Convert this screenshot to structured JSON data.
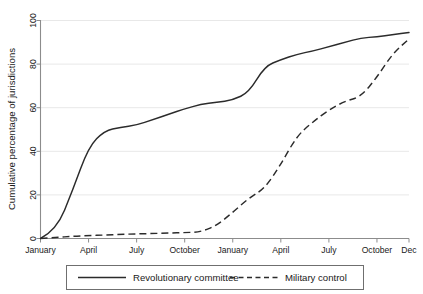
{
  "chart_data": {
    "type": "line",
    "title": "",
    "subtitle": "",
    "xlabel": "",
    "ylabel": "Cumulative percentage of jurisdictions",
    "ylim": [
      0,
      100
    ],
    "xlim": [
      0,
      23
    ],
    "yticks": [
      0,
      20,
      40,
      60,
      80,
      100
    ],
    "ytick_labels": [
      "0",
      "20",
      "40",
      "60",
      "80",
      "100"
    ],
    "xtick_positions": [
      0,
      3,
      6,
      9,
      12,
      15,
      18,
      21,
      23
    ],
    "xtick_labels": [
      "January",
      "April",
      "July",
      "October",
      "January",
      "April",
      "July",
      "October",
      "Dec"
    ],
    "x": [
      0,
      1,
      2,
      3,
      4,
      5,
      6,
      7,
      8,
      9,
      10,
      11,
      12,
      13,
      14,
      15,
      16,
      17,
      18,
      19,
      20,
      21,
      22,
      23
    ],
    "x_month_labels": [
      "January",
      "February",
      "March",
      "April",
      "May",
      "June",
      "July",
      "August",
      "September",
      "October",
      "November",
      "December",
      "January",
      "February",
      "March",
      "April",
      "May",
      "June",
      "July",
      "August",
      "September",
      "October",
      "November",
      "December"
    ],
    "grid": true,
    "grid_axis": "y",
    "legend_position": "below",
    "series": [
      {
        "name": "Revolutionary committee",
        "style": "solid",
        "color": "#2b2b2b",
        "values": [
          0,
          4,
          22,
          42,
          49.5,
          51,
          52,
          54.5,
          57,
          59.5,
          61.5,
          62.5,
          63.5,
          67,
          79,
          82,
          84.5,
          86,
          88,
          90,
          92,
          92.5,
          93.5,
          94.5
        ]
      },
      {
        "name": "Military control",
        "style": "dashed",
        "color": "#2b2b2b",
        "values": [
          0,
          0.5,
          1,
          1.3,
          1.6,
          1.9,
          2.1,
          2.3,
          2.5,
          2.7,
          3,
          6,
          12,
          18.5,
          23,
          34,
          47,
          53.5,
          59,
          63,
          65,
          74,
          85,
          91.5
        ]
      }
    ]
  },
  "legend": {
    "entries": [
      {
        "label": "Revolutionary committee",
        "style": "solid"
      },
      {
        "label": "Military control",
        "style": "dashed"
      }
    ]
  },
  "axes": {
    "y_title": "Cumulative percentage of jurisdictions"
  },
  "colors": {
    "line": "#2b2b2b",
    "grid": "#e8e8e8",
    "axis": "#8c8c8c",
    "background": "#ffffff",
    "text": "#1a1a1a"
  }
}
